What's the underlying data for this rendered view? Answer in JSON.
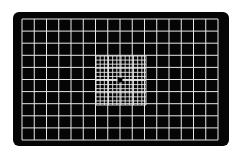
{
  "chart_data": {
    "type": "grid",
    "title": "",
    "colors": {
      "background": "#ffffff",
      "panel": "#050505",
      "lines": "#e8e8e8",
      "center_dot": "#000000"
    },
    "major_grid": {
      "columns": 16,
      "rows": 10,
      "x_start": 22,
      "x_end": 218,
      "y_start": 19,
      "y_end": 140
    },
    "fine_grid": {
      "columns": 12,
      "rows": 12,
      "x_start": 96,
      "x_end": 146,
      "y_start": 56,
      "y_end": 105,
      "subdivision_per_major_cell": 3
    },
    "center_point": {
      "x": 120,
      "y": 80,
      "radius": 2.5
    }
  }
}
